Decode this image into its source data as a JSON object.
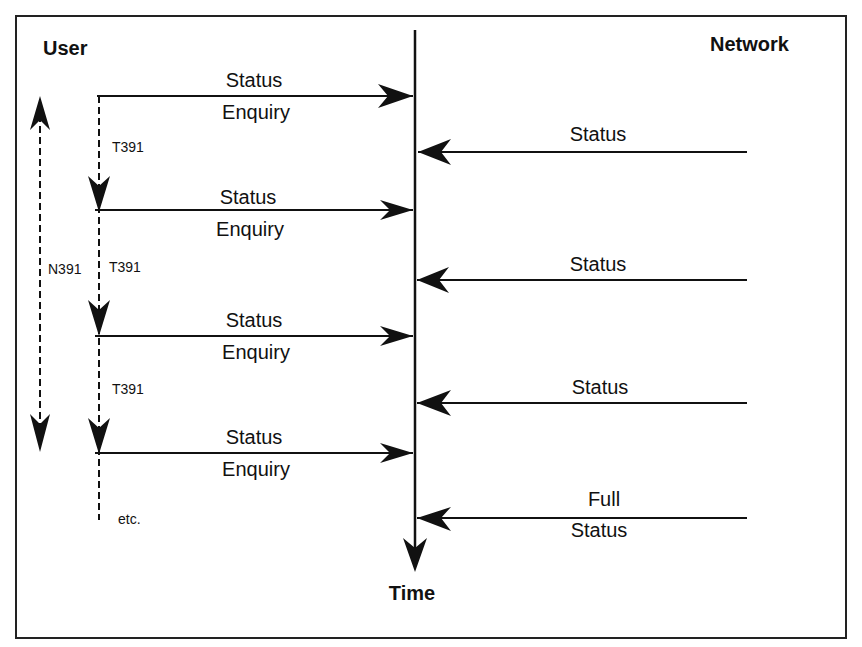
{
  "diagram": {
    "participants": {
      "left": "User",
      "right": "Network"
    },
    "axis_label": "Time",
    "counter_label": "N391",
    "timer_label": "T391",
    "continuation_label": "etc.",
    "user_messages": [
      {
        "line1": "Status",
        "line2": "Enquiry"
      },
      {
        "line1": "Status",
        "line2": "Enquiry"
      },
      {
        "line1": "Status",
        "line2": "Enquiry"
      },
      {
        "line1": "Status",
        "line2": "Enquiry"
      }
    ],
    "network_messages": [
      {
        "line1": "Status"
      },
      {
        "line1": "Status"
      },
      {
        "line1": "Status"
      },
      {
        "line1": "Full",
        "line2": "Status"
      }
    ],
    "timers": [
      "T391",
      "T391",
      "T391"
    ]
  }
}
